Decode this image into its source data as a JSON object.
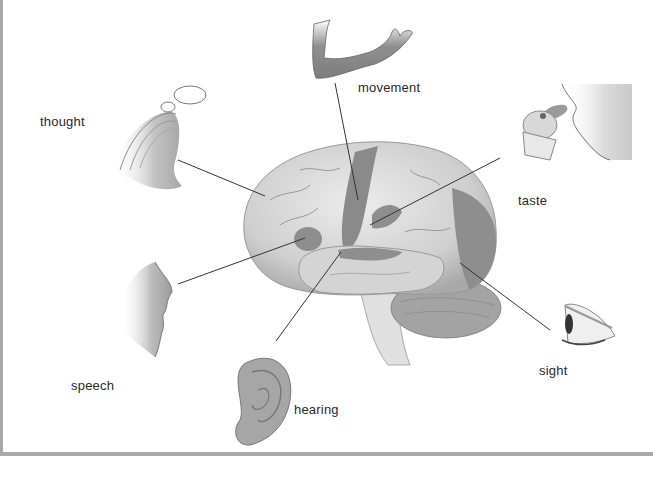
{
  "diagram": {
    "labels": {
      "thought": "thought",
      "movement": "movement",
      "taste": "taste",
      "speech": "speech",
      "hearing": "hearing",
      "sight": "sight"
    },
    "colors": {
      "brain_light": "#d6d6d6",
      "brain_region": "#8a8a8a",
      "leader_line": "#333333",
      "frame_border": "#a8a8a8",
      "skin": "#9a9a9a"
    },
    "icons": [
      "thinking-head-icon",
      "arm-icon",
      "tasting-mouth-icon",
      "speaking-face-icon",
      "ear-icon",
      "eye-icon",
      "brain-illustration"
    ]
  }
}
